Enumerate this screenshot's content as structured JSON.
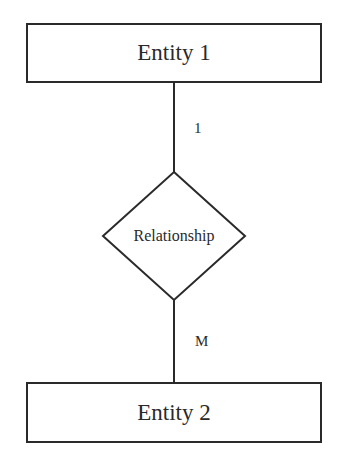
{
  "diagram": {
    "type": "er-diagram",
    "entities": [
      {
        "id": "entity1",
        "label": "Entity 1"
      },
      {
        "id": "entity2",
        "label": "Entity 2"
      }
    ],
    "relationship": {
      "label": "Relationship"
    },
    "cardinalities": {
      "entity1_side": "1",
      "entity2_side": "M"
    },
    "colors": {
      "stroke": "#2a2a2a",
      "background": "#ffffff"
    }
  }
}
